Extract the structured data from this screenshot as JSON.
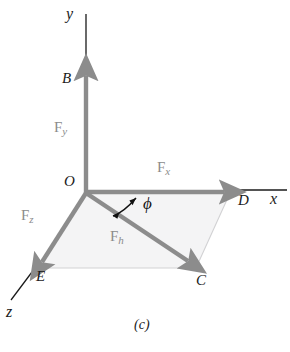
{
  "figure": {
    "caption": "(c)",
    "colors": {
      "vector": "#8c8c8c",
      "vector_dark": "#7d7d7d",
      "axis_line": "#1a1a1a",
      "plane_fill": "#f4f4f5",
      "plane_edge": "#d2d2d4",
      "text": "#1a1a1a",
      "vector_text": "#8c8c8c",
      "background": "#ffffff"
    }
  },
  "axes": [
    {
      "name": "y-axis",
      "label": "y",
      "label_x": 66,
      "label_y": 14
    },
    {
      "name": "x-axis",
      "label": "x",
      "label_x": 270,
      "label_y": 199
    },
    {
      "name": "z-axis",
      "label": "z",
      "label_x": 6,
      "label_y": 312
    }
  ],
  "points": [
    {
      "name": "origin",
      "label": "O",
      "label_x": 64,
      "label_y": 182
    },
    {
      "name": "point-b",
      "label": "B",
      "label_x": 62,
      "label_y": 79
    },
    {
      "name": "point-c",
      "label": "C",
      "label_x": 196,
      "label_y": 281
    },
    {
      "name": "point-d",
      "label": "D",
      "label_x": 238,
      "label_y": 201
    },
    {
      "name": "point-e",
      "label": "E",
      "label_x": 36,
      "label_y": 277
    }
  ],
  "vectors": [
    {
      "name": "force-y",
      "symbol": "F",
      "subscript": "y",
      "label_x": 57,
      "label_y": 128
    },
    {
      "name": "force-x",
      "symbol": "F",
      "subscript": "x",
      "label_x": 160,
      "label_y": 168
    },
    {
      "name": "force-z",
      "symbol": "F",
      "subscript": "z",
      "label_x": 24,
      "label_y": 216
    },
    {
      "name": "force-h",
      "symbol": "F",
      "subscript": "h",
      "label_x": 113,
      "label_y": 237
    }
  ],
  "angles": [
    {
      "name": "phi-angle",
      "label": "ϕ",
      "label_x": 146,
      "label_y": 204
    }
  ],
  "caption": {
    "text": "(c)",
    "x": 134,
    "y": 325
  }
}
